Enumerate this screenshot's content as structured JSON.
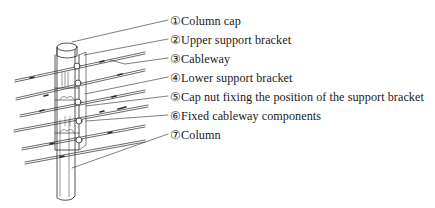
{
  "figure": {
    "type": "exploded-view illustration",
    "line_color": "#2a2a2a"
  },
  "labels": [
    {
      "num": "①",
      "text": "Column cap",
      "y": 14
    },
    {
      "num": "②",
      "text": "Upper support bracket",
      "y": 33
    },
    {
      "num": "③",
      "text": "Cableway",
      "y": 52
    },
    {
      "num": "④",
      "text": "Lower support bracket",
      "y": 71
    },
    {
      "num": "⑤",
      "text": "Cap nut fixing the position of the support bracket",
      "y": 90
    },
    {
      "num": "⑥",
      "text": "Fixed cableway components",
      "y": 109
    },
    {
      "num": "⑦",
      "text": "Column",
      "y": 128
    }
  ]
}
